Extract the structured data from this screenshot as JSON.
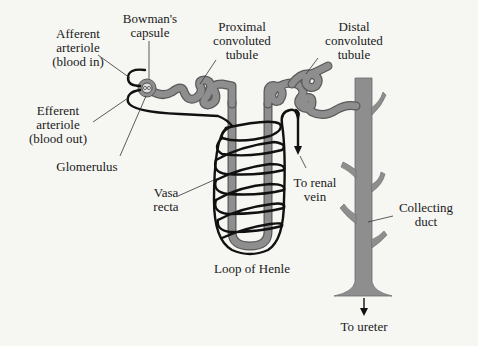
{
  "diagram": {
    "colors": {
      "background": "#f6f6f3",
      "tubule_fill": "#8e8e8e",
      "tubule_outline": "#5a5a5a",
      "vessel": "#111111",
      "leader_line": "#333333",
      "text": "#1a1a1a"
    },
    "labels": {
      "afferent": {
        "line1": "Afferent",
        "line2": "arteriole",
        "line3": "(blood in)"
      },
      "bowman": {
        "line1": "Bowman's",
        "line2": "capsule"
      },
      "proximal": {
        "line1": "Proximal",
        "line2": "convoluted",
        "line3": "tubule"
      },
      "distal": {
        "line1": "Distal",
        "line2": "convoluted",
        "line3": "tubule"
      },
      "efferent": {
        "line1": "Efferent",
        "line2": "arteriole",
        "line3": "(blood out)"
      },
      "glomerulus": {
        "line1": "Glomerulus"
      },
      "vasa_recta": {
        "line1": "Vasa",
        "line2": "recta"
      },
      "renal_vein": {
        "line1": "To renal",
        "line2": "vein"
      },
      "collecting_duct": {
        "line1": "Collecting",
        "line2": "duct"
      },
      "loop_of_henle": {
        "line1": "Loop of Henle"
      },
      "ureter": {
        "line1": "To ureter"
      }
    }
  }
}
